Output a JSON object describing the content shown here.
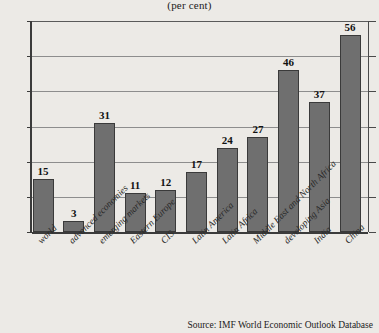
{
  "chart_data": {
    "type": "bar",
    "title": "",
    "subtitle": "(per cent)",
    "xlabel": "",
    "ylabel": "",
    "ylim": [
      0,
      60
    ],
    "yticks": [
      0,
      10,
      20,
      30,
      40,
      50,
      60
    ],
    "grid": true,
    "legend": null,
    "bar_color": "#6f6f6f",
    "bar_edge_color": "#3a3a3a",
    "categories": [
      "world",
      "advanced economies",
      "emerging markets",
      "Eastern Europe",
      "CIS",
      "Latin America",
      "Latin Africa",
      "Middle East and North Africa",
      "developing Asia",
      "India",
      "China"
    ],
    "values": [
      15,
      3,
      31,
      11,
      12,
      17,
      24,
      27,
      46,
      37,
      56
    ],
    "data_labels": [
      "15",
      "3",
      "31",
      "11",
      "12",
      "17",
      "24",
      "27",
      "46",
      "37",
      "56"
    ],
    "annotations": {
      "source": "Source: IMF World Economic Outlook Database"
    }
  }
}
